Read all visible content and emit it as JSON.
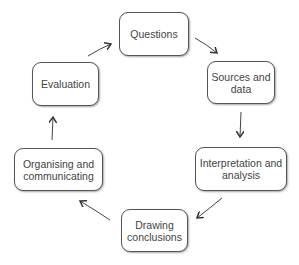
{
  "diagram": {
    "type": "cycle",
    "nodes": [
      {
        "id": "questions",
        "label": "Questions"
      },
      {
        "id": "sources",
        "label": "Sources and data"
      },
      {
        "id": "interpretation",
        "label": "Interpretation and analysis"
      },
      {
        "id": "conclusions",
        "label": "Drawing conclusions"
      },
      {
        "id": "organising",
        "label": "Organising and communicating"
      },
      {
        "id": "evaluation",
        "label": "Evaluation"
      }
    ],
    "edges": [
      {
        "from": "questions",
        "to": "sources"
      },
      {
        "from": "sources",
        "to": "interpretation"
      },
      {
        "from": "interpretation",
        "to": "conclusions"
      },
      {
        "from": "conclusions",
        "to": "organising"
      },
      {
        "from": "organising",
        "to": "evaluation"
      },
      {
        "from": "evaluation",
        "to": "questions"
      }
    ]
  }
}
